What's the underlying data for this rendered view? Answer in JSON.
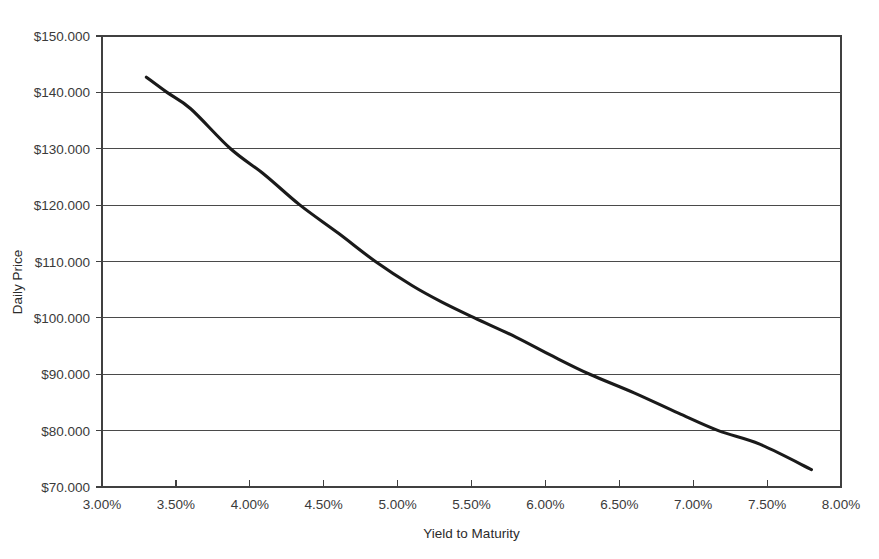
{
  "chart_data": {
    "type": "line",
    "title": "",
    "xlabel": "Yield to Maturity",
    "ylabel": "Daily Price",
    "xlim": [
      3.0,
      8.0
    ],
    "ylim": [
      70,
      150
    ],
    "grid": "horizontal",
    "legend": "none",
    "x_tick_labels": [
      "3.00%",
      "3.50%",
      "4.00%",
      "4.50%",
      "5.00%",
      "5.50%",
      "6.00%",
      "6.50%",
      "7.00%",
      "7.50%",
      "8.00%"
    ],
    "x_tick_values": [
      3.0,
      3.5,
      4.0,
      4.5,
      5.0,
      5.5,
      6.0,
      6.5,
      7.0,
      7.5,
      8.0
    ],
    "y_tick_labels": [
      "$70.000",
      "$80.000",
      "$90.000",
      "$100.000",
      "$110.000",
      "$120.000",
      "$130.000",
      "$140.000",
      "$150.000"
    ],
    "y_tick_values": [
      70,
      80,
      90,
      100,
      110,
      120,
      130,
      140,
      150
    ],
    "series": [
      {
        "name": "Daily Price",
        "color": "#1a1a1a",
        "x": [
          3.3,
          3.44,
          3.6,
          3.87,
          4.1,
          4.34,
          4.6,
          4.85,
          5.1,
          5.3,
          5.52,
          5.8,
          6.05,
          6.3,
          6.6,
          6.9,
          7.17,
          7.45,
          7.8
        ],
        "y": [
          142.7,
          140.0,
          137.1,
          130.0,
          125.4,
          120.0,
          115.0,
          110.0,
          105.7,
          102.8,
          100.0,
          96.6,
          93.2,
          90.0,
          86.7,
          83.1,
          80.0,
          77.6,
          73.1
        ]
      }
    ]
  },
  "axes": {
    "x_title": "Yield to Maturity",
    "y_title": "Daily Price"
  }
}
